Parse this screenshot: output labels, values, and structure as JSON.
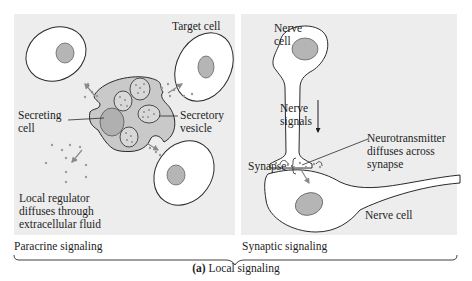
{
  "figure": {
    "caption_letter": "(a)",
    "caption_text": " Local signaling",
    "colors": {
      "panel_bg": "#ededed",
      "cell_fill": "#ffffff",
      "secreting_cell_fill": "#c9c9c9",
      "nucleus_fill": "#b5b5b5",
      "particle": "#9a9a9a",
      "line": "#2a2a2a"
    }
  },
  "paracrine": {
    "section_label": "Paracrine signaling",
    "labels": {
      "target_cell": "Target cell",
      "secreting_cell_1": "Secreting",
      "secreting_cell_2": "cell",
      "secretory_vesicle_1": "Secretory",
      "secretory_vesicle_2": "vesicle",
      "local_regulator_1": "Local regulator",
      "local_regulator_2": "diffuses through",
      "local_regulator_3": "extracellular fluid"
    }
  },
  "synaptic": {
    "section_label": "Synaptic signaling",
    "labels": {
      "nerve_cell_top_1": "Nerve",
      "nerve_cell_top_2": "cell",
      "nerve_signals_1": "Nerve",
      "nerve_signals_2": "signals",
      "neurotransmitter_1": "Neurotransmitter",
      "neurotransmitter_2": "diffuses across",
      "neurotransmitter_3": "synapse",
      "synapse": "Synapse",
      "nerve_cell_bottom": "Nerve cell"
    }
  }
}
